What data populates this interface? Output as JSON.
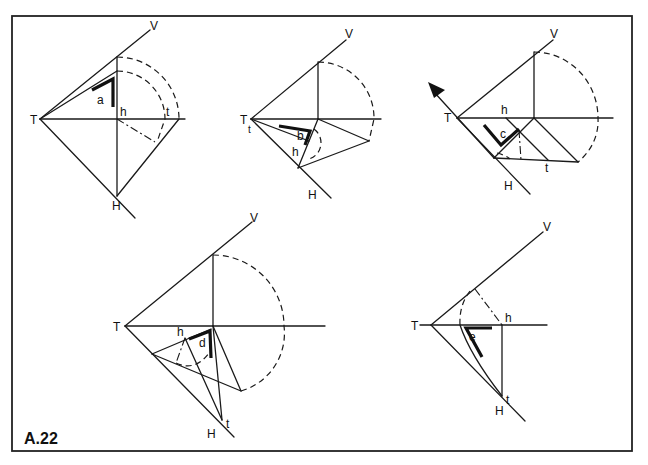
{
  "figure": {
    "title": "A.22",
    "frame_color": "#222222",
    "line_color": "#1a1a1a"
  },
  "panels": [
    {
      "id": "a",
      "angle_label": "a",
      "labels": {
        "T": "T",
        "V": "V",
        "h": "h",
        "t": "t",
        "H": "H"
      }
    },
    {
      "id": "b",
      "angle_label": "b",
      "labels": {
        "T": "T",
        "t": "t",
        "V": "V",
        "h": "h",
        "H": "H"
      }
    },
    {
      "id": "c",
      "angle_label": "c",
      "labels": {
        "T": "T",
        "V": "V",
        "h": "h",
        "t": "t",
        "H": "H"
      },
      "arrow_icon": "arrow-up-left"
    },
    {
      "id": "d",
      "angle_label": "d",
      "labels": {
        "T": "T",
        "V": "V",
        "h": "h",
        "t": "t",
        "H": "H"
      }
    },
    {
      "id": "e",
      "angle_label": "e",
      "labels": {
        "T": "T",
        "V": "V",
        "h": "h",
        "t": "t",
        "H": "H"
      }
    }
  ]
}
